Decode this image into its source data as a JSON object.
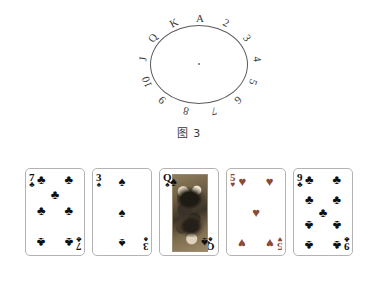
{
  "page": {
    "background": "#ffffff",
    "width": 378,
    "height": 304
  },
  "figure3": {
    "caption": "图 3",
    "type": "circle-clock-diagram",
    "center_dot": true,
    "labels": [
      {
        "text": "A",
        "angle_deg": 0
      },
      {
        "text": "2",
        "angle_deg": 27.7
      },
      {
        "text": "3",
        "angle_deg": 55.4
      },
      {
        "text": "4",
        "angle_deg": 83.1
      },
      {
        "text": "5",
        "angle_deg": 110.8
      },
      {
        "text": "6",
        "angle_deg": 138.5
      },
      {
        "text": "7",
        "angle_deg": 166.2
      },
      {
        "text": "8",
        "angle_deg": 193.8
      },
      {
        "text": "9",
        "angle_deg": 221.5
      },
      {
        "text": "10",
        "angle_deg": 249.2
      },
      {
        "text": "J",
        "angle_deg": 276.9
      },
      {
        "text": "Q",
        "angle_deg": 304.6
      },
      {
        "text": "K",
        "angle_deg": 332.3
      }
    ]
  },
  "figure4": {
    "caption": "图 4",
    "colors": {
      "black_suit": "#101010",
      "red_suit": "#8a4a36",
      "card_border": "#b3b3b3"
    },
    "cards": [
      {
        "rank": "7",
        "suit": "clubs",
        "suit_glyph": "♣",
        "color": "black",
        "pip_count": 7,
        "is_face": false
      },
      {
        "rank": "3",
        "suit": "spades",
        "suit_glyph": "♠",
        "color": "black",
        "pip_count": 3,
        "is_face": false
      },
      {
        "rank": "Q",
        "suit": "spades",
        "suit_glyph": "♠",
        "color": "black",
        "pip_count": 0,
        "is_face": true
      },
      {
        "rank": "5",
        "suit": "hearts",
        "suit_glyph": "♥",
        "color": "red",
        "pip_count": 5,
        "is_face": false
      },
      {
        "rank": "9",
        "suit": "clubs",
        "suit_glyph": "♣",
        "color": "black",
        "pip_count": 9,
        "is_face": false
      }
    ]
  }
}
